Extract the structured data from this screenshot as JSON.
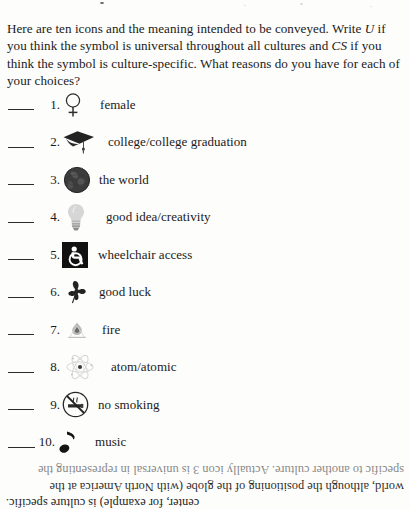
{
  "document": {
    "intro_parts": [
      "Here are ten icons and the meaning intended to be conveyed. Write ",
      "U",
      " if you think the symbol is universal throughout all cultures and ",
      "CS",
      " if you think the symbol is culture-specific. What reasons do you have for each of your choices?"
    ],
    "intro_full": "Here are ten icons and the meaning intended to be conveyed. Write U if you think the symbol is universal throughout all cultures and CS if you think the symbol is culture-specific. What reasons do you have for each of your choices?"
  },
  "items": [
    {
      "number": "1.",
      "icon": "female-symbol-icon",
      "label": "female"
    },
    {
      "number": "2.",
      "icon": "graduation-cap-icon",
      "label": "college/college graduation"
    },
    {
      "number": "3.",
      "icon": "globe-icon",
      "label": "the world"
    },
    {
      "number": "4.",
      "icon": "light-bulb-icon",
      "label": "good idea/creativity"
    },
    {
      "number": "5.",
      "icon": "wheelchair-access-icon",
      "label": "wheelchair access"
    },
    {
      "number": "6.",
      "icon": "four-leaf-clover-icon",
      "label": "good luck"
    },
    {
      "number": "7.",
      "icon": "flame-icon",
      "label": "fire"
    },
    {
      "number": "8.",
      "icon": "atom-icon",
      "label": "atom/atomic"
    },
    {
      "number": "9.",
      "icon": "no-smoking-icon",
      "label": "no smoking"
    },
    {
      "number": "10.",
      "icon": "music-note-icon",
      "label": "music"
    }
  ],
  "footnote": {
    "line1": "specific to another culture. Actually icon 3 is universal in representing the",
    "line2": "world, although  the positioning of the globe (with North America at the",
    "line3": "center, for example) is culture specific."
  },
  "colors": {
    "page_background": "#fdfdfc",
    "text": "#1a1a1a",
    "rule": "#2b2b2b"
  }
}
